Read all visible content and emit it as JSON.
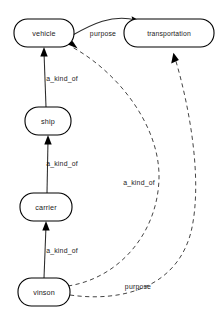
{
  "diagram": {
    "type": "semantic-network",
    "background_color": "#ffffff",
    "line_color": "#2b2b2b",
    "text_color": "#1a1a1a",
    "nodes": [
      {
        "id": "vehicle",
        "label": "vehicle",
        "shape": "rounded-rect",
        "cx": 44,
        "cy": 33,
        "rx": 30,
        "ry": 14
      },
      {
        "id": "transportation",
        "label": "transportation",
        "shape": "rounded-rect",
        "cx": 169,
        "cy": 33,
        "rx": 45,
        "ry": 14
      },
      {
        "id": "ship",
        "label": "ship",
        "shape": "rounded-rect",
        "cx": 48,
        "cy": 121,
        "rx": 23,
        "ry": 14
      },
      {
        "id": "carrier",
        "label": "carrier",
        "shape": "rounded-rect",
        "cx": 46,
        "cy": 207,
        "rx": 26,
        "ry": 14
      },
      {
        "id": "vinson",
        "label": "vinson",
        "shape": "rounded-rect",
        "cx": 44,
        "cy": 292,
        "rx": 26,
        "ry": 14
      }
    ],
    "edges": [
      {
        "id": "ship-vehicle",
        "from": "ship",
        "to": "vehicle",
        "label": "a_kind_of",
        "style": "solid",
        "label_x": 62,
        "label_y": 78
      },
      {
        "id": "carrier-ship",
        "from": "carrier",
        "to": "ship",
        "label": "a_kind_of",
        "style": "solid",
        "label_x": 62,
        "label_y": 163
      },
      {
        "id": "vinson-carrier",
        "from": "vinson",
        "to": "carrier",
        "label": "a_kind_of",
        "style": "solid",
        "label_x": 62,
        "label_y": 250
      },
      {
        "id": "vehicle-transportation",
        "from": "vehicle",
        "to": "transportation",
        "label": "purpose",
        "style": "solid",
        "label_x": 103,
        "label_y": 33
      },
      {
        "id": "vinson-vehicle",
        "from": "vinson",
        "to": "vehicle",
        "label": "a_kind_of",
        "style": "dashed",
        "label_x": 139,
        "label_y": 182
      },
      {
        "id": "vinson-transportation",
        "from": "vinson",
        "to": "transportation",
        "label": "purpose",
        "style": "dashed",
        "label_x": 138,
        "label_y": 286
      }
    ],
    "edge_labels": {
      "a_kind_of": "a_kind_of",
      "purpose": "purpose"
    }
  }
}
